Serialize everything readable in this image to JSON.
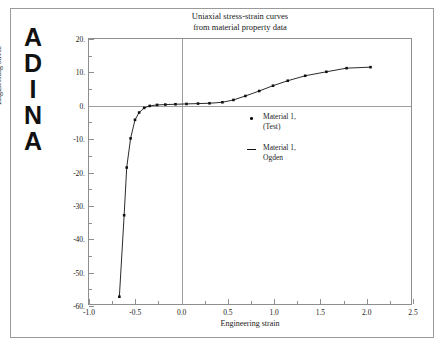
{
  "logo": {
    "name": "ADINA",
    "letters": [
      "A",
      "D",
      "I",
      "N",
      "A"
    ]
  },
  "chart_data": {
    "type": "line",
    "title": "Uniaxial stress-strain curves from material property data",
    "title_lines": [
      "Uniaxial stress-strain curves",
      "from material property data"
    ],
    "xlabel": "Engineering strain",
    "ylabel": "Engineering stress",
    "xlim": [
      -1.0,
      2.5
    ],
    "ylim": [
      -60.0,
      20.0
    ],
    "xticks": [
      -1.0,
      -0.5,
      0.0,
      0.5,
      1.0,
      1.5,
      2.0,
      2.5
    ],
    "xtick_labels": [
      "-1.0",
      "-0.5",
      "0.0",
      "0.5",
      "1.0",
      "1.5",
      "2.0",
      "2.5"
    ],
    "xticks_minor": [
      -0.75,
      -0.25,
      0.25,
      0.75,
      1.25,
      1.75,
      2.25
    ],
    "yticks": [
      20.0,
      10.0,
      0.0,
      -10.0,
      -20.0,
      -30.0,
      -40.0,
      -50.0,
      -60.0
    ],
    "ytick_labels": [
      "20.",
      "10.",
      "0.",
      "-10.",
      "-20.",
      "-30.",
      "-40.",
      "-50.",
      "-60."
    ],
    "yticks_minor": [
      15.0,
      5.0,
      -5.0,
      -15.0,
      -25.0,
      -35.0,
      -45.0,
      -55.0
    ],
    "grid": false,
    "zero_lines": {
      "x": 0.0,
      "y": 0.0
    },
    "legend_position": "center-right",
    "series": [
      {
        "name": "Material 1, (Test)",
        "label_lines": [
          "Material 1,",
          "(Test)"
        ],
        "marker": "dot",
        "color": "#111111",
        "points": [
          [
            -0.67,
            -57.8
          ],
          [
            -0.618,
            -33.2
          ],
          [
            -0.59,
            -18.8
          ],
          [
            -0.548,
            -10.0
          ],
          [
            -0.5,
            -4.4
          ],
          [
            -0.455,
            -2.2
          ],
          [
            -0.4,
            -0.8
          ],
          [
            -0.34,
            -0.2
          ],
          [
            -0.26,
            0.1
          ],
          [
            -0.17,
            0.2
          ],
          [
            -0.06,
            0.3
          ],
          [
            0.06,
            0.4
          ],
          [
            0.185,
            0.5
          ],
          [
            0.31,
            0.6
          ],
          [
            0.45,
            0.9
          ],
          [
            0.57,
            1.6
          ],
          [
            0.7,
            2.8
          ],
          [
            0.85,
            4.3
          ],
          [
            1.0,
            5.9
          ],
          [
            1.16,
            7.4
          ],
          [
            1.35,
            8.9
          ],
          [
            1.58,
            10.1
          ],
          [
            1.8,
            11.2
          ],
          [
            2.06,
            11.5
          ]
        ]
      },
      {
        "name": "Material 1, Ogden",
        "label_lines": [
          "Material 1,",
          "Ogden"
        ],
        "marker": "line",
        "color": "#111111",
        "points": [
          [
            -0.67,
            -57.8
          ],
          [
            -0.618,
            -33.2
          ],
          [
            -0.59,
            -18.8
          ],
          [
            -0.548,
            -10.0
          ],
          [
            -0.5,
            -4.4
          ],
          [
            -0.455,
            -2.2
          ],
          [
            -0.4,
            -0.8
          ],
          [
            -0.34,
            -0.2
          ],
          [
            -0.26,
            0.1
          ],
          [
            -0.17,
            0.2
          ],
          [
            -0.06,
            0.3
          ],
          [
            0.06,
            0.4
          ],
          [
            0.185,
            0.5
          ],
          [
            0.31,
            0.6
          ],
          [
            0.45,
            0.9
          ],
          [
            0.57,
            1.6
          ],
          [
            0.7,
            2.8
          ],
          [
            0.85,
            4.3
          ],
          [
            1.0,
            5.9
          ],
          [
            1.16,
            7.4
          ],
          [
            1.35,
            8.9
          ],
          [
            1.58,
            10.1
          ],
          [
            1.8,
            11.2
          ],
          [
            2.06,
            11.5
          ]
        ]
      }
    ]
  },
  "colors": {
    "frame": "#9a9a9a",
    "axis": "#8e8e8e",
    "zero_line": "#9e9e9e",
    "data": "#111111",
    "text": "#1a1a1a",
    "background": "#ffffff"
  }
}
